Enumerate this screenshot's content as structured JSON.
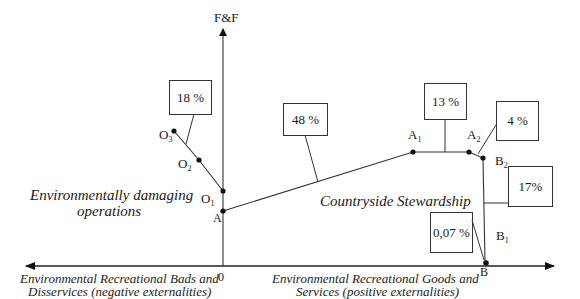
{
  "axes": {
    "y_label": "F&F",
    "origin_label": "0",
    "x_left_label_line1": "Environmental Recreational Bads and",
    "x_left_label_line2": "Disservices (negative externalities)",
    "x_right_label_line1": "Environmental Recreational Goods and",
    "x_right_label_line2": "Services (positive externalities)"
  },
  "regions": {
    "left_line1": "Environmentally damaging",
    "left_line2": "operations",
    "right": "Countryside Stewardship"
  },
  "points": {
    "O3": {
      "base": "O",
      "sub": "3"
    },
    "O2": {
      "base": "O",
      "sub": "2"
    },
    "O1": {
      "base": "O",
      "sub": "1"
    },
    "A": {
      "base": "A",
      "sub": ""
    },
    "A1": {
      "base": "A",
      "sub": "1"
    },
    "A2": {
      "base": "A",
      "sub": "2"
    },
    "B2": {
      "base": "B",
      "sub": "2"
    },
    "B1": {
      "base": "B",
      "sub": "1"
    },
    "B": {
      "base": "B",
      "sub": ""
    }
  },
  "callouts": {
    "o_segment": "18 %",
    "a_a1_segment": "48 %",
    "a1_a2_segment": "13 %",
    "a2_b2_segment": "4 %",
    "b2_b_segment": "17%",
    "b1_b_segment": "0,07 %"
  }
}
